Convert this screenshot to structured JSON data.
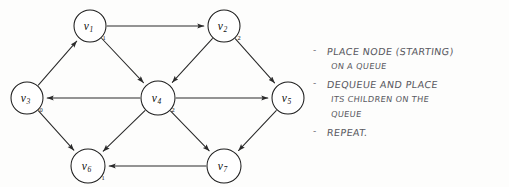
{
  "diagram": {
    "type": "directed-graph",
    "nodes": [
      {
        "id": "v1",
        "label": "v",
        "sub": "1",
        "cx": 90,
        "cy": 26,
        "r": 16,
        "dist": "1",
        "dist_dx": 14,
        "dist_dy": 14
      },
      {
        "id": "v2",
        "label": "v",
        "sub": "2",
        "cx": 224,
        "cy": 26,
        "r": 16,
        "dist": "2",
        "dist_dx": 15,
        "dist_dy": 14
      },
      {
        "id": "v3",
        "label": "v",
        "sub": "3",
        "cx": 27,
        "cy": 98,
        "r": 16,
        "dist": "0",
        "dist_dx": 14,
        "dist_dy": 14
      },
      {
        "id": "v4",
        "label": "v",
        "sub": "4",
        "cx": 158,
        "cy": 98,
        "r": 17,
        "dist": "2",
        "dist_dx": 15,
        "dist_dy": 14
      },
      {
        "id": "v5",
        "label": "v",
        "sub": "5",
        "cx": 288,
        "cy": 98,
        "r": 16,
        "dist": "",
        "dist_dx": 0,
        "dist_dy": 0
      },
      {
        "id": "v6",
        "label": "v",
        "sub": "6",
        "cx": 88,
        "cy": 166,
        "r": 17,
        "dist": "1",
        "dist_dx": 15,
        "dist_dy": 14
      },
      {
        "id": "v7",
        "label": "v",
        "sub": "7",
        "cx": 224,
        "cy": 166,
        "r": 17,
        "dist": "",
        "dist_dx": 0,
        "dist_dy": 0
      }
    ],
    "edges": [
      {
        "from": "v3",
        "to": "v1"
      },
      {
        "from": "v1",
        "to": "v2"
      },
      {
        "from": "v1",
        "to": "v4"
      },
      {
        "from": "v2",
        "to": "v4"
      },
      {
        "from": "v2",
        "to": "v5"
      },
      {
        "from": "v4",
        "to": "v3"
      },
      {
        "from": "v4",
        "to": "v5"
      },
      {
        "from": "v3",
        "to": "v6"
      },
      {
        "from": "v4",
        "to": "v6"
      },
      {
        "from": "v4",
        "to": "v7"
      },
      {
        "from": "v5",
        "to": "v7"
      },
      {
        "from": "v7",
        "to": "v6"
      }
    ]
  },
  "notes": {
    "bullets": [
      {
        "marker": "-",
        "lines": [
          "PLACE NODE (STARTING)",
          "ON A QUEUE"
        ]
      },
      {
        "marker": "-",
        "lines": [
          "DEQUEUE AND PLACE",
          "ITS CHILDREN ON THE",
          "QUEUE"
        ]
      },
      {
        "marker": "-",
        "lines": [
          "REPEAT."
        ]
      }
    ]
  },
  "colors": {
    "ink": "#1d1d1d",
    "edge": "#2a2a2a",
    "pencil": "#5a5a62",
    "paper": "#fdfdfc"
  }
}
